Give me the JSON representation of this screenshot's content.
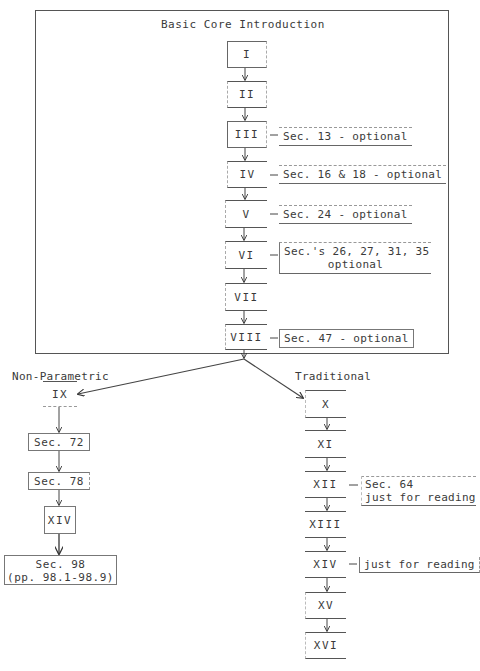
{
  "diagram": {
    "core_title": "Basic Core Introduction",
    "core_chapters": [
      {
        "label": "I",
        "note": null
      },
      {
        "label": "II",
        "note": null
      },
      {
        "label": "III",
        "note": "Sec. 13 - optional"
      },
      {
        "label": "IV",
        "note": "Sec. 16 & 18 - optional"
      },
      {
        "label": "V",
        "note": "Sec. 24 - optional"
      },
      {
        "label": "VI",
        "note_line1": "Sec.'s 26, 27, 31, 35",
        "note_line2": "optional"
      },
      {
        "label": "VII",
        "note": null
      },
      {
        "label": "VIII",
        "note": "Sec. 47 - optional"
      }
    ],
    "branches": {
      "left": {
        "title": "Non-Parametric",
        "steps": [
          "IX",
          "Sec. 72",
          "Sec. 78",
          "XIV"
        ],
        "final_line1": "Sec. 98",
        "final_line2": "(pp. 98.1-98.9)"
      },
      "right": {
        "title": "Traditional",
        "steps": [
          "X",
          "XI",
          "XII",
          "XIII",
          "XIV",
          "XV",
          "XVI"
        ],
        "xii_note_line1": "Sec. 64",
        "xii_note_line2": "just for reading",
        "xiv_note": "just for reading"
      }
    }
  }
}
